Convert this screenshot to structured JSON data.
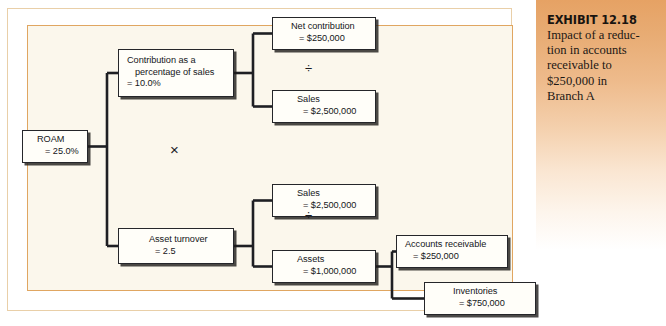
{
  "exhibit": {
    "title": "EXHIBIT 12.18",
    "caption_lines": [
      "Impact of a reduc-",
      "tion in accounts",
      "receivable to",
      "$250,000 in",
      "Branch A"
    ]
  },
  "diagram": {
    "nodes": {
      "roam": {
        "label": "ROAM",
        "value": "= 25.0%"
      },
      "contribution": {
        "label_line1": "Contribution as a",
        "label_line2": "percentage of sales",
        "value": "= 10.0%"
      },
      "asset_turnover": {
        "label": "Asset turnover",
        "value": "= 2.5"
      },
      "net_contribution": {
        "label": "Net contribution",
        "value": "= $250,000"
      },
      "sales_top": {
        "label": "Sales",
        "value": "= $2,500,000"
      },
      "sales_bottom": {
        "label": "Sales",
        "value": "= $2,500,000"
      },
      "assets": {
        "label": "Assets",
        "value": "= $1,000,000"
      },
      "accounts_receivable": {
        "label": "Accounts receivable",
        "value": "= $250,000"
      },
      "inventories": {
        "label": "Inventories",
        "value": "= $750,000"
      }
    },
    "operators": {
      "multiply": "×",
      "divide_top": "÷",
      "divide_bottom": "÷"
    },
    "colors": {
      "panel_background": "#fbf7ec",
      "inner_border": "#e0a661",
      "outer_border": "#e9cfa8",
      "connector": "#1e1f23",
      "box_fill": "#fffef9",
      "box_border": "#25262a",
      "exhibit_gradient_top": "#e6a264",
      "exhibit_gradient_bottom": "#ffffff"
    }
  }
}
